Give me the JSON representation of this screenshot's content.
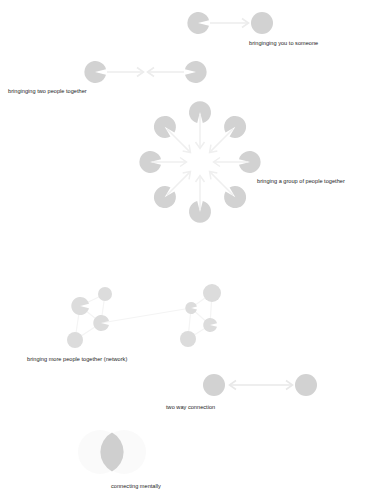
{
  "page": {
    "background": "#ffffff",
    "width": 366,
    "height": 491
  },
  "palette": {
    "shape_fill": "#d2d2d2",
    "shape_fill_light": "#dcdcdc",
    "shape_fill_faint": "#f1f1f1",
    "arrow": "#ececec",
    "text": "#1b1b1b"
  },
  "captions": [
    {
      "id": "cap-0",
      "text": "bringinging you to someone"
    },
    {
      "id": "cap-1",
      "text": "bringinging two people together"
    },
    {
      "id": "cap-2",
      "text": "bringing a group of people together"
    },
    {
      "id": "cap-3",
      "text": "bringing more people together (network)"
    },
    {
      "id": "cap-4",
      "text": "two way connection"
    },
    {
      "id": "cap-5",
      "text": "connecting mentally"
    }
  ],
  "diagrams": [
    {
      "name": "one-to-one",
      "caption": "bringinging you to someone",
      "nodes": [
        {
          "kind": "pacman",
          "cx": 198,
          "cy": 23,
          "r": 11,
          "mouth_deg": 0
        },
        {
          "kind": "circle",
          "cx": 262,
          "cy": 23,
          "r": 11
        }
      ],
      "arrows": [
        {
          "from": [
            210,
            23
          ],
          "to": [
            248,
            23
          ],
          "heads": 1
        }
      ]
    },
    {
      "name": "two-people-together",
      "caption": "bringinging two people together",
      "nodes": [
        {
          "kind": "pacman",
          "cx": 95,
          "cy": 72,
          "r": 11,
          "mouth_deg": 0
        },
        {
          "kind": "pacman",
          "cx": 196,
          "cy": 72,
          "r": 11,
          "mouth_deg": 180
        }
      ],
      "arrows": [
        {
          "from": [
            106,
            72
          ],
          "to": [
            143,
            72
          ],
          "heads": 1
        },
        {
          "from": [
            185,
            72
          ],
          "to": [
            148,
            72
          ],
          "heads": 1
        }
      ]
    },
    {
      "name": "group-radial",
      "caption": "bringing a group of people together",
      "center": [
        200,
        162
      ],
      "ring_radius": 50,
      "node_count": 8,
      "node_radius": 11,
      "nodes": [
        {
          "kind": "pacman",
          "angle_deg": 270
        },
        {
          "kind": "pacman",
          "angle_deg": 315
        },
        {
          "kind": "pacman",
          "angle_deg": 0
        },
        {
          "kind": "pacman",
          "angle_deg": 45
        },
        {
          "kind": "pacman",
          "angle_deg": 90
        },
        {
          "kind": "pacman",
          "angle_deg": 135
        },
        {
          "kind": "pacman",
          "angle_deg": 180
        },
        {
          "kind": "pacman",
          "angle_deg": 225
        }
      ]
    },
    {
      "name": "network",
      "caption": "bringing more people together (network)",
      "nodes": [
        {
          "kind": "circle",
          "cx": 105,
          "cy": 294,
          "r": 7
        },
        {
          "kind": "pacman",
          "cx": 80,
          "cy": 306,
          "r": 9,
          "mouth_deg": 0
        },
        {
          "kind": "pacman",
          "cx": 101,
          "cy": 323,
          "r": 8,
          "mouth_deg": 0
        },
        {
          "kind": "circle",
          "cx": 75,
          "cy": 340,
          "r": 8
        },
        {
          "kind": "circle",
          "cx": 212,
          "cy": 293,
          "r": 9
        },
        {
          "kind": "pacman",
          "cx": 191,
          "cy": 308,
          "r": 6,
          "mouth_deg": 0
        },
        {
          "kind": "pacman",
          "cx": 210,
          "cy": 325,
          "r": 7,
          "mouth_deg": 0
        },
        {
          "kind": "circle",
          "cx": 188,
          "cy": 339,
          "r": 8
        }
      ]
    },
    {
      "name": "two-way-connection",
      "caption": "two way connection",
      "nodes": [
        {
          "kind": "circle",
          "cx": 214,
          "cy": 385,
          "r": 11
        },
        {
          "kind": "circle",
          "cx": 306,
          "cy": 385,
          "r": 11
        }
      ],
      "arrows": [
        {
          "from": [
            230,
            385
          ],
          "to": [
            290,
            385
          ],
          "heads": 2
        }
      ]
    },
    {
      "name": "connecting-mentally",
      "caption": "connecting mentally",
      "shape": "vesica-piscis",
      "circles": [
        {
          "cx": 100,
          "cy": 452,
          "r": 22
        },
        {
          "cx": 124,
          "cy": 452,
          "r": 22
        }
      ]
    }
  ]
}
